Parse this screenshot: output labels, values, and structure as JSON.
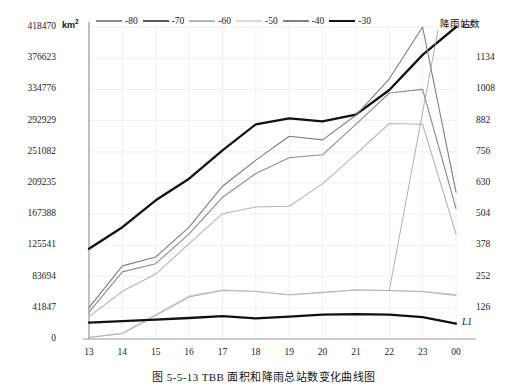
{
  "caption": "图 5-5-13    TBB 面积和降雨总站数变化曲线图",
  "axis": {
    "unit_label": "km",
    "unit_sup": "2",
    "y_left_ticks": [
      "418470",
      "376623",
      "334776",
      "292929",
      "251082",
      "209235",
      "167388",
      "125541",
      "83694",
      "41847",
      "0"
    ],
    "y_right_ticks": [
      "1134",
      "1008",
      "882",
      "756",
      "630",
      "504",
      "378",
      "252",
      "126"
    ],
    "x_ticks": [
      "13",
      "14",
      "15",
      "16",
      "17",
      "18",
      "19",
      "20",
      "21",
      "22",
      "23",
      "00"
    ]
  },
  "annotations": {
    "rain_stations": "降雨站数",
    "l2": "L2",
    "l1": "L1"
  },
  "legend": {
    "items": [
      {
        "label": "-80",
        "color": "#8c8c8c",
        "width": 1.1
      },
      {
        "label": "-70",
        "color": "#5a5a5a",
        "width": 1.1
      },
      {
        "label": "-60",
        "color": "#b4b4b4",
        "width": 1.1
      },
      {
        "label": "-50",
        "color": "#d8d8d8",
        "width": 1.1
      },
      {
        "label": "-40",
        "color": "#7e7e7e",
        "width": 1.1
      },
      {
        "label": "-30",
        "color": "#111111",
        "width": 2.3
      }
    ]
  },
  "chart_data": {
    "type": "line",
    "title": "TBB 面积和降雨总站数变化曲线图",
    "xlabel": "",
    "ylabel": "km2",
    "grid": true,
    "legend_position": "top",
    "x": [
      "13",
      "14",
      "15",
      "16",
      "17",
      "18",
      "19",
      "20",
      "21",
      "22",
      "23",
      "00"
    ],
    "ylim": [
      0,
      418470
    ],
    "y_right_lim": [
      0,
      1260
    ],
    "y_left_tick_step": 41847,
    "y_right_tick_step": 126,
    "series": [
      {
        "name": "-30",
        "axis": "left",
        "color": "#111111",
        "width": 2.3,
        "values": [
          121000,
          150000,
          186000,
          215000,
          253000,
          288000,
          296000,
          292000,
          301000,
          334000,
          381000,
          418470
        ]
      },
      {
        "name": "-40",
        "axis": "left",
        "color": "#7e7e7e",
        "width": 1.1,
        "values": [
          42000,
          98000,
          110000,
          150000,
          205000,
          240000,
          272000,
          267000,
          300000,
          349000,
          418470,
          197000
        ]
      },
      {
        "name": "-50",
        "axis": "left",
        "color": "#8c8c8c",
        "width": 1.1,
        "values": [
          36000,
          90000,
          101000,
          141000,
          190000,
          222000,
          243000,
          247000,
          288000,
          330000,
          334776,
          175000
        ]
      },
      {
        "name": "-60",
        "axis": "left",
        "color": "#b4b4b4",
        "width": 1.1,
        "values": [
          30000,
          64000,
          87000,
          128000,
          168000,
          177000,
          178000,
          208000,
          248000,
          289000,
          288000,
          141000
        ]
      },
      {
        "name": "-70",
        "axis": "left",
        "color": "#d8d8d8",
        "width": 1.1,
        "values": [
          2000,
          8000,
          33000,
          58000,
          66000,
          64000,
          59000,
          62000,
          66000,
          65000,
          64000,
          60000
        ]
      },
      {
        "name": "降雨站数 L2",
        "axis": "right",
        "color": "#b4b4b4",
        "width": 1.1,
        "values": [
          6,
          22,
          95,
          170,
          196,
          192,
          179,
          188,
          198,
          196,
          191,
          176
        ]
      },
      {
        "name": "L1",
        "axis": "right",
        "color": "#111111",
        "width": 2.3,
        "values": [
          66,
          72,
          78,
          85,
          92,
          83,
          90,
          98,
          100,
          98,
          88,
          62
        ]
      }
    ]
  }
}
